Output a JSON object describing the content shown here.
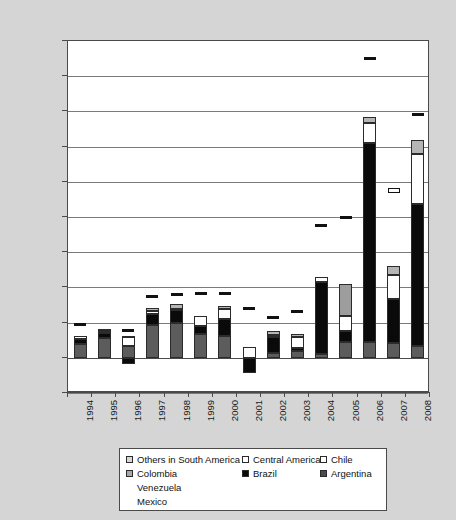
{
  "chart_data": {
    "type": "bar",
    "title": "",
    "subtitle": "",
    "xlabel": "",
    "ylabel": "",
    "stacked": true,
    "grid": true,
    "legend_position": "bottom",
    "ylim": [
      -5000,
      45000
    ],
    "ytick_labels": [
      "45,000",
      "40,000",
      "35,000",
      "30,000",
      "25,000",
      "20,000",
      "15,000",
      "10,000",
      "5,000",
      "0",
      "-5,000"
    ],
    "ytick_values": [
      45000,
      40000,
      35000,
      30000,
      25000,
      20000,
      15000,
      10000,
      5000,
      0,
      -5000
    ],
    "categories": [
      "1994",
      "1995",
      "1996",
      "1997",
      "1998",
      "1999",
      "2000",
      "2001",
      "2002",
      "2003",
      "2004",
      "2005",
      "2006",
      "2007",
      "2008"
    ],
    "series": [
      {
        "name": "Argentina",
        "color": "#5c5c5c",
        "values": [
          1900,
          2800,
          1700,
          4700,
          4900,
          3400,
          3100,
          0,
          700,
          1000,
          600,
          2200,
          2200,
          2100,
          1700
        ]
      },
      {
        "name": "Brazil",
        "color": "#0a0a0a",
        "values": [
          700,
          700,
          -900,
          1500,
          1900,
          1100,
          2400,
          -2100,
          2200,
          400,
          10100,
          1600,
          28300,
          6200,
          20200
        ]
      },
      {
        "name": "Chile",
        "color": "#ffffff",
        "values": [
          500,
          300,
          1200,
          500,
          200,
          1400,
          1400,
          1600,
          300,
          1500,
          800,
          2100,
          2900,
          3500,
          7000
        ]
      },
      {
        "name": "Central America",
        "color": "#ffffff",
        "values": [
          0,
          0,
          0,
          0,
          0,
          0,
          0,
          0,
          0,
          0,
          0,
          0,
          0,
          0,
          0
        ]
      },
      {
        "name": "Colombia",
        "color": "#9d9d9d",
        "values": [
          0,
          0,
          0,
          0,
          0,
          0,
          0,
          0,
          0,
          0,
          0,
          4600,
          0,
          0,
          0
        ]
      },
      {
        "name": "Others in South America",
        "color": "#b5b5b5",
        "values": [
          0,
          300,
          200,
          400,
          600,
          0,
          500,
          0,
          600,
          500,
          0,
          0,
          800,
          1200,
          2000
        ]
      }
    ],
    "totals": [
      3100,
      4100,
      2200,
      7100,
      7600,
      5900,
      7400,
      -500,
      3800,
      3400,
      11500,
      10500,
      34200,
      13000,
      30900
    ],
    "markers": {
      "name": "marker-dash",
      "values": [
        4700,
        null,
        3800,
        8700,
        8900,
        9000,
        9100,
        6900,
        5700,
        6500,
        18700,
        19800,
        42500,
        23800,
        34500
      ],
      "hollow_years": [
        "2007"
      ]
    }
  },
  "legend": {
    "items": [
      {
        "label": "Others in South America",
        "swatch": "others",
        "has_swatch": true
      },
      {
        "label": "Central America",
        "swatch": "central",
        "has_swatch": true
      },
      {
        "label": "Chile",
        "swatch": "chile",
        "has_swatch": true
      },
      {
        "label": "Colombia",
        "swatch": "colombia",
        "has_swatch": true
      },
      {
        "label": "Brazil",
        "swatch": "brazil",
        "has_swatch": true
      },
      {
        "label": "Argentina",
        "swatch": "argentina",
        "has_swatch": true
      },
      {
        "label": "Venezuela",
        "swatch": "none",
        "has_swatch": false
      },
      {
        "label": "Mexico",
        "swatch": "none",
        "has_swatch": false
      }
    ]
  },
  "colors": {
    "background": "#d5d5d5",
    "plot_background": "#ffffff",
    "axis": "#4a4a4a",
    "gridline": "#7a7a7a",
    "text": "#1a1a1a"
  }
}
